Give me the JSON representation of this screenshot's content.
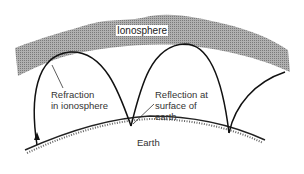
{
  "diagram": {
    "labels": {
      "ionosphere": "Ionosphere",
      "refraction": [
        "Refraction",
        "in ionosphere"
      ],
      "reflection": [
        "Reflection at",
        "surface of",
        "earth"
      ],
      "earth": "Earth"
    },
    "colors": {
      "ionosphere_fill": "#9a9a9a",
      "ray": "#111111",
      "text": "#333333"
    }
  }
}
